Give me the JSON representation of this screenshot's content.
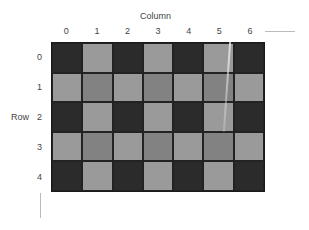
{
  "diagram": {
    "column_axis_title": "Column",
    "row_axis_title": "Row",
    "columns": [
      "0",
      "1",
      "2",
      "3",
      "4",
      "5",
      "6"
    ],
    "rows": [
      "0",
      "1",
      "2",
      "3",
      "4"
    ],
    "colors": {
      "dark": "#2b2b2b",
      "light": "#9a9a9a",
      "mid": "#828282"
    },
    "cells": [
      [
        "dark",
        "light",
        "dark",
        "light",
        "dark",
        "light",
        "dark"
      ],
      [
        "light",
        "mid",
        "light",
        "mid",
        "light",
        "mid",
        "light"
      ],
      [
        "dark",
        "light",
        "dark",
        "light",
        "dark",
        "light",
        "dark"
      ],
      [
        "light",
        "mid",
        "light",
        "mid",
        "light",
        "mid",
        "light"
      ],
      [
        "dark",
        "light",
        "dark",
        "light",
        "dark",
        "light",
        "dark"
      ]
    ]
  }
}
